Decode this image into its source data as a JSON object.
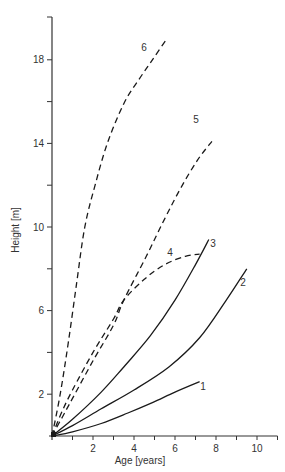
{
  "chart_data": {
    "type": "line",
    "title": "",
    "xlabel": "Age [years]",
    "ylabel": "Height [m]",
    "xlim": [
      0,
      11
    ],
    "ylim": [
      0,
      20
    ],
    "x_ticks": [
      2,
      4,
      6,
      8,
      10
    ],
    "x_minor_ticks": [
      1,
      3,
      5,
      7,
      9,
      11
    ],
    "y_ticks": [
      2,
      6,
      10,
      14,
      18
    ],
    "y_minor_ticks": [
      4,
      8,
      12,
      16
    ],
    "grid": false,
    "legend": "none (curves labeled inline with numbers)",
    "series": [
      {
        "name": "1",
        "style": "solid",
        "points": [
          [
            0,
            0
          ],
          [
            1,
            0.2
          ],
          [
            2.4,
            0.6
          ],
          [
            3.7,
            1.1
          ],
          [
            4.9,
            1.6
          ],
          [
            6.0,
            2.1
          ],
          [
            7.2,
            2.6
          ]
        ]
      },
      {
        "name": "2",
        "style": "solid",
        "points": [
          [
            0,
            0
          ],
          [
            1,
            0.5
          ],
          [
            2.4,
            1.3
          ],
          [
            4.0,
            2.2
          ],
          [
            5.7,
            3.3
          ],
          [
            7.2,
            4.7
          ],
          [
            8.5,
            6.5
          ],
          [
            9.5,
            8.0
          ]
        ]
      },
      {
        "name": "3",
        "style": "solid",
        "points": [
          [
            0,
            0
          ],
          [
            1,
            0.8
          ],
          [
            2.4,
            2.1
          ],
          [
            3.5,
            3.3
          ],
          [
            4.8,
            4.8
          ],
          [
            6.0,
            6.5
          ],
          [
            7.0,
            8.2
          ],
          [
            7.65,
            9.4
          ]
        ]
      },
      {
        "name": "4",
        "style": "dashed",
        "points": [
          [
            0,
            0
          ],
          [
            0.5,
            1.2
          ],
          [
            1,
            2.2
          ],
          [
            2,
            4.0
          ],
          [
            3,
            5.6
          ],
          [
            3.5,
            6.5
          ],
          [
            4.5,
            7.5
          ],
          [
            5.5,
            8.2
          ],
          [
            6.5,
            8.6
          ],
          [
            7.2,
            8.7
          ]
        ]
      },
      {
        "name": "5",
        "style": "dashed",
        "points": [
          [
            0,
            0
          ],
          [
            0.5,
            0.9
          ],
          [
            1,
            1.8
          ],
          [
            2,
            3.6
          ],
          [
            3,
            5.3
          ],
          [
            3.5,
            6.5
          ],
          [
            4.6,
            8.6
          ],
          [
            5.5,
            10.4
          ],
          [
            6.3,
            11.9
          ],
          [
            7.1,
            13.2
          ],
          [
            7.8,
            14.1
          ]
        ]
      },
      {
        "name": "6",
        "style": "dashed",
        "points": [
          [
            0,
            0
          ],
          [
            0.4,
            2.0
          ],
          [
            0.8,
            4.5
          ],
          [
            1.2,
            7.3
          ],
          [
            1.6,
            10.0
          ],
          [
            2.1,
            12.0
          ],
          [
            2.7,
            14.0
          ],
          [
            3.5,
            15.9
          ],
          [
            4.2,
            17.0
          ],
          [
            4.9,
            18.0
          ],
          [
            5.6,
            19.0
          ]
        ]
      }
    ]
  },
  "axes": {
    "x_title": "Age [years]",
    "y_title": "Height [m]",
    "x_tick_labels": [
      "2",
      "4",
      "6",
      "8",
      "10"
    ],
    "y_tick_labels": [
      "2",
      "6",
      "10",
      "14",
      "18"
    ]
  },
  "curve_labels": [
    "1",
    "2",
    "3",
    "4",
    "5",
    "6"
  ],
  "colors": {
    "line": "#1a1a1a",
    "axis": "#333333",
    "text": "#333333",
    "background": "#ffffff"
  }
}
